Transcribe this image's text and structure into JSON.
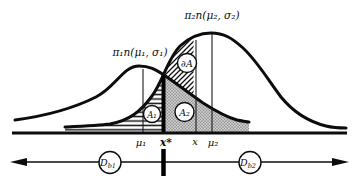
{
  "figure": {
    "title_hint": "Two overlapping normal densities with classification regions",
    "curve1_label": "π₁n(μ₁, σ₁)",
    "curve2_label": "π₂n(μ₂, σ₂)",
    "axis_labels": {
      "mu1": "μ₁",
      "xstar": "x*",
      "x": "x",
      "mu2": "μ₂"
    },
    "regions": {
      "a1": "A₁",
      "a2": "A₂",
      "dA": "∂A"
    },
    "bottom": {
      "d1_base": "D",
      "d1_sub": "b1",
      "d2_base": "D",
      "d2_sub": "b2"
    },
    "colors": {
      "ink": "#0c0c0c",
      "stipple_bg": "#cbcbcb",
      "stipple_dot": "#7d7d7d"
    }
  }
}
